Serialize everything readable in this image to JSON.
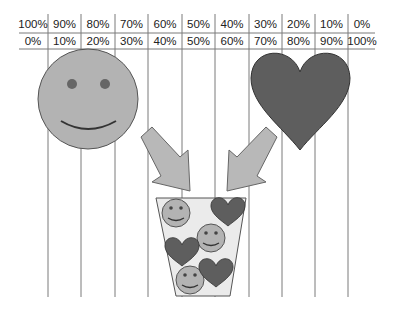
{
  "table": {
    "top_row": [
      "100%",
      "90%",
      "80%",
      "70%",
      "60%",
      "50%",
      "40%",
      "30%",
      "20%",
      "10%",
      "0%"
    ],
    "bottom_row": [
      "0%",
      "10%",
      "20%",
      "30%",
      "40%",
      "50%",
      "60%",
      "70%",
      "80%",
      "90%",
      "100%"
    ]
  },
  "shapes": {
    "left": "smiley-face",
    "right": "heart",
    "container": "cup-of-mixed-smileys-and-hearts",
    "cup_contents": [
      "smiley",
      "heart",
      "smiley",
      "heart",
      "smiley",
      "heart"
    ]
  },
  "colors": {
    "smiley_fill": "#b3b3b3",
    "heart_fill": "#5e5e5e",
    "arrow_fill": "#b8b8b8",
    "cup_fill": "#ebebeb",
    "line": "#6e6e6e"
  }
}
